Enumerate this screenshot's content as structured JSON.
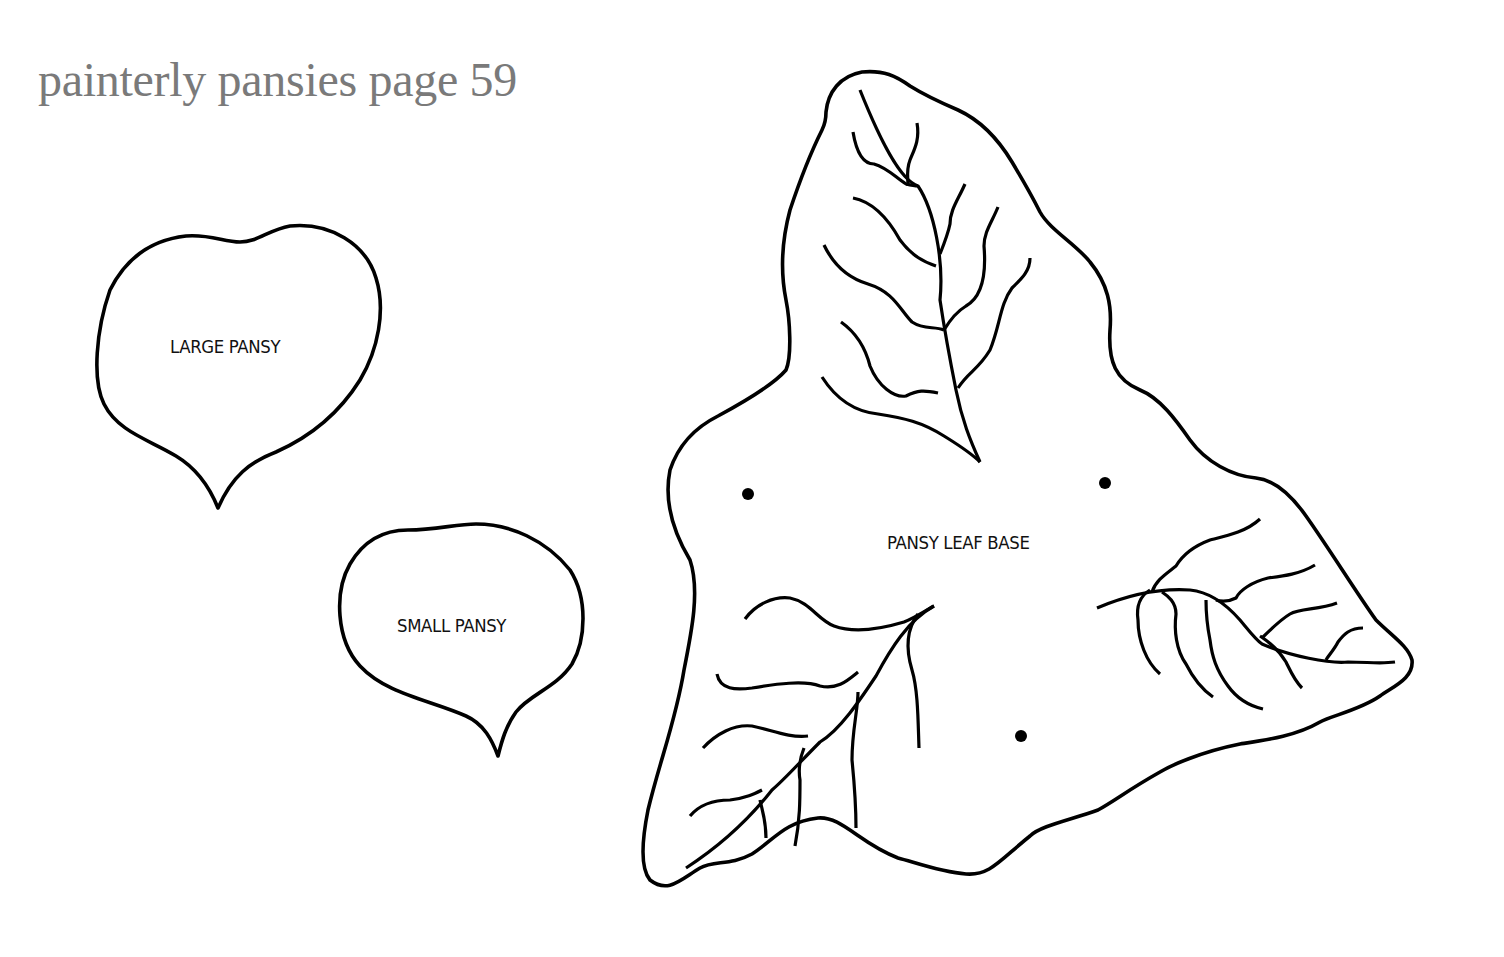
{
  "page": {
    "title": "painterly pansies page 59",
    "title_color": "#7a7a7a"
  },
  "templates": [
    {
      "id": "large-pansy",
      "label": "LARGE PANSY"
    },
    {
      "id": "small-pansy",
      "label": "SMALL PANSY"
    },
    {
      "id": "pansy-leaf-base",
      "label": "PANSY LEAF BASE",
      "marker_dots": 3
    }
  ],
  "colors": {
    "background": "#ffffff",
    "outline": "#000000",
    "label_text": "#111111"
  }
}
